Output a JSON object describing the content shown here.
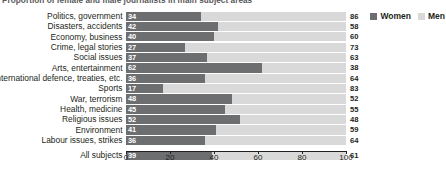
{
  "chart_data": {
    "type": "bar",
    "subtype": "stacked-horizontal-100pct",
    "title": "Proportion of female and male journalists in main subject areas",
    "xlabel": "",
    "ylabel": "",
    "xlim": [
      0,
      100
    ],
    "xticks": [
      0,
      20,
      40,
      60,
      80,
      100
    ],
    "grid": false,
    "legend_position": "top-right",
    "categories": [
      "Politics, government",
      "Disasters, accidents",
      "Economy, business",
      "Crime, legal stories",
      "Social issues",
      "Arts, entertainment",
      "International defence, treaties, etc.",
      "Sports",
      "War, terrorism",
      "Health, medicine",
      "Religious issues",
      "Environment",
      "Labour issues, strikes",
      "All subjects"
    ],
    "series": [
      {
        "name": "Women",
        "color": "#6d6e70",
        "values": [
          34,
          42,
          40,
          27,
          37,
          62,
          36,
          17,
          48,
          45,
          52,
          41,
          36,
          39
        ]
      },
      {
        "name": "Men",
        "color": "#d9d9d9",
        "values": [
          86,
          58,
          60,
          73,
          63,
          38,
          64,
          83,
          52,
          55,
          48,
          59,
          64,
          61
        ]
      }
    ]
  },
  "legend": {
    "items": [
      {
        "label": "Women",
        "color": "#6d6e70"
      },
      {
        "label": "Men",
        "color": "#d9d9d9"
      }
    ]
  },
  "axis": {
    "ticks": [
      "0",
      "20",
      "40",
      "60",
      "80",
      "100"
    ]
  },
  "colors": {
    "women": "#6d6e70",
    "men": "#d9d9d9",
    "title": "#58585a",
    "text": "#231f20",
    "value_on_bar": "#ffffff",
    "background": "#ffffff"
  }
}
